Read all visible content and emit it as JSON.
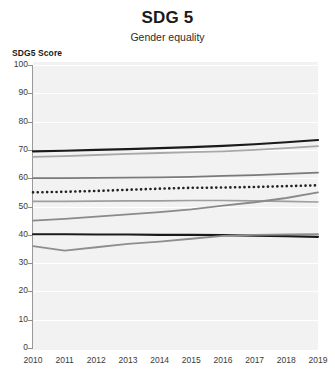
{
  "header": {
    "title": "SDG 5",
    "subtitle": "Gender equality"
  },
  "axis": {
    "y_label": "SDG5 Score",
    "y_ticks": [
      "100",
      "90",
      "80",
      "70",
      "60",
      "50",
      "40",
      "30",
      "20",
      "10",
      "0"
    ],
    "x_ticks": [
      "2010",
      "2011",
      "2012",
      "2013",
      "2014",
      "2015",
      "2016",
      "2017",
      "2018",
      "2019"
    ]
  },
  "colors": {
    "background": "#ffffff",
    "plot_background": "#f2f2f2",
    "gridline": "#ffffff",
    "axis": "#9a9a9a",
    "series_dark": "#1a1a1a",
    "series_mid": "#6e6e6e",
    "series_light": "#9e9e9e",
    "text": "#231f20"
  },
  "chart_data": {
    "type": "line",
    "title": "SDG 5",
    "subtitle": "Gender equality",
    "xlabel": "",
    "ylabel": "SDG5 Score",
    "xlim": [
      2010,
      2019
    ],
    "ylim": [
      0,
      100
    ],
    "ytick_step": 10,
    "grid": true,
    "legend": "none",
    "x": [
      2010,
      2011,
      2012,
      2013,
      2014,
      2015,
      2016,
      2017,
      2018,
      2019
    ],
    "series": [
      {
        "name": "series-1-dark-top",
        "style": "solid",
        "color": "#1a1a1a",
        "width": 2.2,
        "values": [
          69.5,
          69.7,
          70.0,
          70.3,
          70.6,
          71.0,
          71.4,
          72.0,
          72.7,
          73.5
        ]
      },
      {
        "name": "series-2-light-top",
        "style": "solid",
        "color": "#a8a8a8",
        "width": 1.8,
        "values": [
          67.5,
          67.8,
          68.2,
          68.6,
          68.9,
          69.2,
          69.5,
          70.0,
          70.6,
          71.3
        ]
      },
      {
        "name": "series-3-mid",
        "style": "solid",
        "color": "#7a7a7a",
        "width": 1.8,
        "values": [
          60.0,
          60.0,
          60.1,
          60.2,
          60.3,
          60.5,
          60.8,
          61.1,
          61.5,
          62.0
        ]
      },
      {
        "name": "series-4-dotted",
        "style": "dotted",
        "color": "#222222",
        "width": 2.2,
        "values": [
          55.0,
          55.2,
          55.5,
          55.9,
          56.3,
          56.6,
          56.7,
          56.9,
          57.2,
          57.5
        ]
      },
      {
        "name": "series-5-light-mid",
        "style": "solid",
        "color": "#9e9e9e",
        "width": 1.6,
        "values": [
          51.8,
          51.8,
          51.9,
          52.0,
          52.0,
          52.1,
          52.1,
          52.0,
          51.8,
          51.6
        ]
      },
      {
        "name": "series-6-rising",
        "style": "solid",
        "color": "#8a8a8a",
        "width": 1.8,
        "values": [
          45.0,
          45.6,
          46.4,
          47.2,
          48.0,
          49.0,
          50.3,
          51.5,
          53.0,
          55.0
        ]
      },
      {
        "name": "series-7-dark-flat",
        "style": "solid",
        "color": "#1a1a1a",
        "width": 2.2,
        "values": [
          40.2,
          40.2,
          40.1,
          40.1,
          40.0,
          40.0,
          39.9,
          39.7,
          39.5,
          39.3
        ]
      },
      {
        "name": "series-8-low-rising",
        "style": "solid",
        "color": "#8e8e8e",
        "width": 1.8,
        "values": [
          36.0,
          34.4,
          35.6,
          36.8,
          37.6,
          38.6,
          39.6,
          40.0,
          40.1,
          40.2
        ]
      }
    ]
  }
}
